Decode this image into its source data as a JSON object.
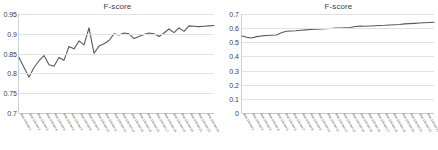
{
  "figure": {
    "background": "#ffffff",
    "line_color": "#595959",
    "grid_color": "#e2e2e2",
    "axis_color": "#c8c8c8",
    "text_color": "#404040"
  },
  "chart_data": [
    {
      "type": "line",
      "panel": "left",
      "title": "F-score",
      "xlabel": "",
      "ylabel": "",
      "ylim": [
        0.7,
        0.95
      ],
      "yticks": [
        "0.7",
        "0.75",
        "0.8",
        "0.85",
        "0.9",
        "0.95"
      ],
      "ytick_values": [
        0.7,
        0.75,
        0.8,
        0.85,
        0.9,
        0.95
      ],
      "grid": true,
      "legend": false,
      "categories": [
        "step-100-iter-1",
        "step-100-iter-2",
        "step-100-iter-3",
        "step-100-iter-4",
        "step-100-iter-5",
        "step-100-iter-6",
        "step-100-iter-7",
        "step-100-iter-8",
        "step-100-iter-9",
        "step-100-iter-10",
        "step-100-iter-11",
        "step-100-iter-12",
        "step-100-iter-13",
        "step-100-iter-14",
        "step-100-iter-15",
        "step-100-iter-16",
        "step-100-iter-17",
        "step-100-iter-18",
        "step-100-iter-19",
        "step-100-iter-20",
        "step-100-iter-21",
        "step-100-iter-22",
        "step-100-iter-23"
      ],
      "values": [
        0.84,
        0.815,
        0.79,
        0.815,
        0.832,
        0.845,
        0.822,
        0.818,
        0.84,
        0.833,
        0.868,
        0.862,
        0.882,
        0.872,
        0.915,
        0.851,
        0.869,
        0.875,
        0.883,
        0.9,
        0.897,
        0.902,
        0.9,
        0.888,
        0.893,
        0.898,
        0.902,
        0.9,
        0.893,
        0.902,
        0.912,
        0.903,
        0.915,
        0.906,
        0.92,
        0.919,
        0.918,
        0.919,
        0.92,
        0.921
      ]
    },
    {
      "type": "line",
      "panel": "right",
      "title": "F-score",
      "xlabel": "",
      "ylabel": "",
      "ylim": [
        0,
        0.7
      ],
      "yticks": [
        "0",
        "0.1",
        "0.2",
        "0.3",
        "0.4",
        "0.5",
        "0.6",
        "0.7"
      ],
      "ytick_values": [
        0,
        0.1,
        0.2,
        0.3,
        0.4,
        0.5,
        0.6,
        0.7
      ],
      "grid": true,
      "legend": false,
      "categories": [
        "step-100-iter-1",
        "step-100-iter-2",
        "step-100-iter-3",
        "step-100-iter-4",
        "step-100-iter-5",
        "step-100-iter-6",
        "step-100-iter-7",
        "step-100-iter-8",
        "step-100-iter-9",
        "step-100-iter-10",
        "step-100-iter-11",
        "step-100-iter-12",
        "step-100-iter-13",
        "step-100-iter-14",
        "step-100-iter-15",
        "step-100-iter-16",
        "step-100-iter-17",
        "step-100-iter-18",
        "step-100-iter-19",
        "step-100-iter-20",
        "step-100-iter-21",
        "step-100-iter-22",
        "step-100-iter-23"
      ],
      "values": [
        0.545,
        0.535,
        0.53,
        0.54,
        0.545,
        0.548,
        0.55,
        0.552,
        0.568,
        0.578,
        0.58,
        0.582,
        0.585,
        0.588,
        0.59,
        0.592,
        0.594,
        0.596,
        0.598,
        0.6,
        0.6,
        0.602,
        0.604,
        0.612,
        0.614,
        0.613,
        0.615,
        0.617,
        0.619,
        0.62,
        0.622,
        0.624,
        0.626,
        0.63,
        0.632,
        0.634,
        0.636,
        0.638,
        0.64,
        0.642
      ]
    }
  ]
}
